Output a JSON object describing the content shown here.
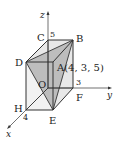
{
  "figure": {
    "colors": {
      "edge": "#333333",
      "face_light": "#e6e6e6",
      "triangle_shade": "#b8b8b8",
      "background": "#ffffff"
    },
    "axes": {
      "x_label": "x",
      "y_label": "y",
      "z_label": "z"
    },
    "ticks": {
      "x": "4",
      "y": "3",
      "z": "5"
    },
    "vertices": {
      "O": "O",
      "A": "A(4, 3, 5)",
      "B": "B",
      "C": "C",
      "D": "D",
      "E": "E",
      "F": "F",
      "H": "H"
    },
    "shaded_triangle": [
      "D",
      "B",
      "E"
    ]
  }
}
